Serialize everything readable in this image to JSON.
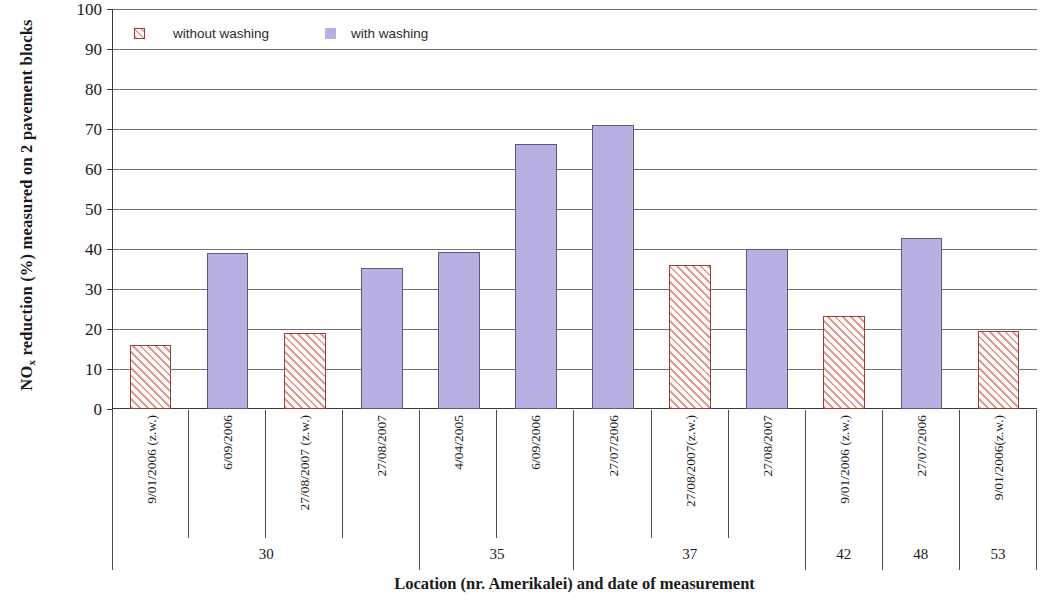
{
  "chart_data": {
    "type": "bar",
    "title": "",
    "xlabel": "Location (nr. Amerikalei) and date of measurement",
    "ylabel": "NOx reduction (%) measured on 2 pavement blocks",
    "ylabel_prefix": "NO",
    "ylabel_subscript": "x",
    "ylabel_suffix": " reduction (%) measured on 2 pavement blocks",
    "ylim": [
      0,
      100
    ],
    "ytick_step": 10,
    "yticks": [
      100,
      90,
      80,
      70,
      60,
      50,
      40,
      30,
      20,
      10,
      0
    ],
    "grid": true,
    "legend_position": "top-left-inside",
    "legend": [
      {
        "name": "without washing",
        "color": "#e79a90",
        "pattern": "diagonal-hatch",
        "border": "#9a4038"
      },
      {
        "name": "with washing",
        "color": "#b7b1e3",
        "pattern": "solid",
        "border": "#5d5a78"
      }
    ],
    "categories": [
      "9/01/2006 (z.w.)",
      "6/09/2006",
      "27/08/2007 (z.w.)",
      "27/08/2007",
      "4/04/2005",
      "6/09/2006",
      "27/07/2006",
      "27/08/2007(z.w.)",
      "27/08/2007",
      "9/01/2006 (z.w.)",
      "27/07/2006",
      "9/01/2006(z.w.)"
    ],
    "values": [
      16,
      39,
      19,
      35.3,
      39.3,
      66.2,
      71,
      36,
      40,
      23.3,
      42.8,
      19.4
    ],
    "series_of_bar": [
      "without washing",
      "with washing",
      "without washing",
      "with washing",
      "with washing",
      "with washing",
      "with washing",
      "without washing",
      "with washing",
      "without washing",
      "with washing",
      "without washing"
    ],
    "groups": [
      {
        "label": "30",
        "bars": 4
      },
      {
        "label": "35",
        "bars": 2
      },
      {
        "label": "37",
        "bars": 3
      },
      {
        "label": "42",
        "bars": 1
      },
      {
        "label": "48",
        "bars": 1
      },
      {
        "label": "53",
        "bars": 1
      }
    ]
  }
}
